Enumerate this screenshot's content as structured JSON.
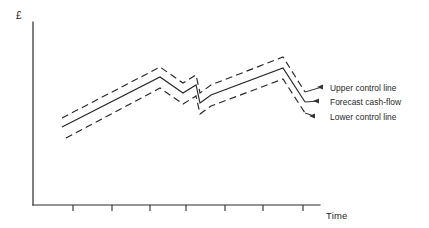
{
  "figure": {
    "background_color": "#ffffff",
    "stroke_color": "#262626",
    "width": 429,
    "height": 228
  },
  "axes": {
    "y_label": "£",
    "x_label": "Time",
    "y_axis": {
      "x": 33,
      "y_top": 22,
      "y_bottom": 205
    },
    "x_axis": {
      "y": 205,
      "x_left": 33,
      "x_right": 320
    },
    "x_ticks": [
      73,
      112,
      150,
      186,
      225,
      263,
      303
    ],
    "tick_length": 6,
    "grid": false,
    "y_tick_labels": [],
    "x_tick_labels": []
  },
  "callouts": [
    {
      "key": "upper",
      "label": "Upper control line",
      "arrow_x": 322,
      "arrow_y": 87,
      "text_x": 330,
      "text_y": 83
    },
    {
      "key": "middle",
      "label": "Forecast cash-flow",
      "arrow_x": 318,
      "arrow_y": 101,
      "text_x": 330,
      "text_y": 97
    },
    {
      "key": "lower",
      "label": "Lower control line",
      "arrow_x": 314,
      "arrow_y": 116,
      "text_x": 330,
      "text_y": 112
    }
  ],
  "chart_data": {
    "type": "line",
    "title": "",
    "subtitle": "",
    "xlabel": "Time",
    "ylabel": "£",
    "grid": false,
    "legend_position": "right-callouts",
    "xlim": [
      33,
      320
    ],
    "ylim": [
      205,
      22
    ],
    "axis_note": "y values are screen pixels measured from the top; smaller y = higher cash-flow value",
    "annotations": [
      "Upper control line",
      "Forecast cash-flow",
      "Lower control line"
    ],
    "series": [
      {
        "name": "Upper control line",
        "style": "dashed",
        "points": [
          [
            62,
            118
          ],
          [
            160,
            67
          ],
          [
            183,
            83
          ],
          [
            196,
            75
          ],
          [
            200,
            93
          ],
          [
            211,
            85
          ],
          [
            283,
            57
          ],
          [
            305,
            92
          ]
        ]
      },
      {
        "name": "Forecast cash-flow",
        "style": "solid",
        "points": [
          [
            62,
            127
          ],
          [
            160,
            77
          ],
          [
            183,
            93
          ],
          [
            196,
            85
          ],
          [
            200,
            103
          ],
          [
            211,
            95
          ],
          [
            283,
            68
          ],
          [
            305,
            102
          ]
        ]
      },
      {
        "name": "Lower control line",
        "style": "dashed",
        "points": [
          [
            66,
            138
          ],
          [
            160,
            88
          ],
          [
            183,
            104
          ],
          [
            196,
            96
          ],
          [
            200,
            114
          ],
          [
            211,
            106
          ],
          [
            283,
            79
          ],
          [
            305,
            113
          ]
        ]
      }
    ]
  }
}
